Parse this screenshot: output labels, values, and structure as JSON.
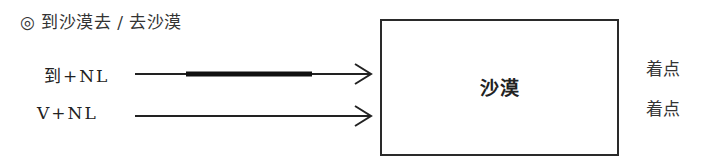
{
  "title": "◎ 到沙漠去 / 去沙漠",
  "rows": [
    {
      "label": "到+NL",
      "note": "着点",
      "highlighted_segment": true
    },
    {
      "label": "V+NL",
      "note": "着点",
      "highlighted_segment": false
    }
  ],
  "box": {
    "label": "沙漠"
  },
  "colors": {
    "line": "#222222",
    "box_border": "#2a2a2a",
    "background": "#ffffff"
  }
}
